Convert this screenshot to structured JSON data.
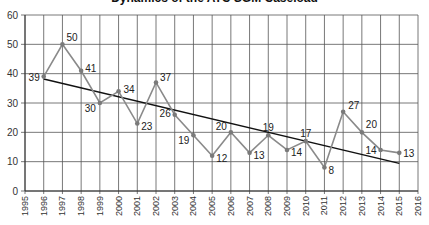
{
  "chart_data": {
    "type": "line",
    "title": "Dynamics of the ATC SGM Caseload",
    "xlabel": "",
    "ylabel": "",
    "xlim": [
      1995,
      2016
    ],
    "ylim": [
      0,
      60
    ],
    "yticks": [
      0,
      10,
      20,
      30,
      40,
      50,
      60
    ],
    "xticks": [
      1995,
      1996,
      1997,
      1998,
      1999,
      2000,
      2001,
      2002,
      2003,
      2004,
      2005,
      2006,
      2007,
      2008,
      2009,
      2010,
      2011,
      2012,
      2013,
      2014,
      2015,
      2016
    ],
    "grid": true,
    "legend": null,
    "series": [
      {
        "name": "Cases",
        "color": "#8a8a8a",
        "x": [
          1996,
          1997,
          1998,
          1999,
          2000,
          2001,
          2002,
          2003,
          2004,
          2005,
          2006,
          2007,
          2008,
          2009,
          2010,
          2011,
          2012,
          2013,
          2014,
          2015
        ],
        "values": [
          39,
          50,
          41,
          30,
          34,
          23,
          37,
          26,
          19,
          12,
          20,
          13,
          19,
          14,
          17,
          8,
          27,
          20,
          14,
          13
        ],
        "labels": [
          "39",
          "50",
          "41",
          "30",
          "34",
          "23",
          "37",
          "26",
          "19",
          "12",
          "20",
          "13",
          "19",
          "14",
          "17",
          "8",
          "27",
          "20",
          "14",
          "13"
        ]
      },
      {
        "name": "Linear trend",
        "color": "#111111",
        "x": [
          1996,
          2015
        ],
        "values": [
          38.2,
          9.4
        ]
      }
    ]
  }
}
